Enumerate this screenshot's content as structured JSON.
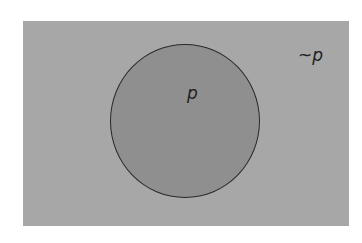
{
  "diagram": {
    "type": "venn",
    "universe": {
      "label": "~p",
      "fill": "#a7a7a7"
    },
    "set": {
      "label": "p",
      "fill": "#8f8f8f",
      "stroke": "#2a2a2a"
    }
  }
}
